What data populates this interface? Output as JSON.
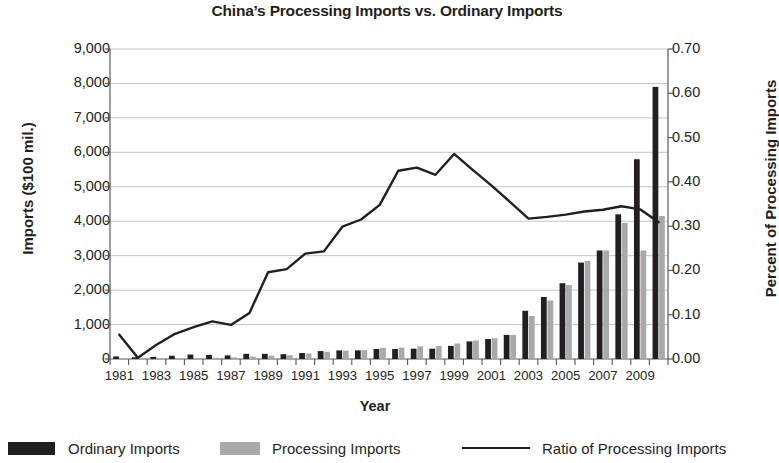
{
  "chart_data": {
    "type": "bar",
    "title": "China’s Processing Imports vs. Ordinary Imports",
    "xlabel": "Year",
    "ylabel": "Imports ($100 mil.)",
    "y2label": "Percent of Processing Imports",
    "ylim": [
      0,
      9000
    ],
    "y2lim": [
      0.0,
      0.7
    ],
    "ytick_labels": [
      "9,000",
      "8,000",
      "7,000",
      "6,000",
      "5,000",
      "4,000",
      "3,000",
      "2,000",
      "1,000",
      "0"
    ],
    "ytick_values": [
      9000,
      8000,
      7000,
      6000,
      5000,
      4000,
      3000,
      2000,
      1000,
      0
    ],
    "y2tick_labels": [
      "0.70",
      "0.60",
      "0.50",
      "0.40",
      "0.30",
      "0.20",
      "0.10",
      "0.00"
    ],
    "y2tick_values": [
      0.7,
      0.6,
      0.5,
      0.4,
      0.3,
      0.2,
      0.1,
      0.0
    ],
    "grid": true,
    "legend_position": "bottom",
    "categories": [
      1981,
      1982,
      1983,
      1984,
      1985,
      1986,
      1987,
      1988,
      1989,
      1990,
      1991,
      1992,
      1993,
      1994,
      1995,
      1996,
      1997,
      1998,
      1999,
      2000,
      2001,
      2002,
      2003,
      2004,
      2005,
      2006,
      2007,
      2008,
      2009,
      2010
    ],
    "xtick_labels": [
      "1981",
      "1983",
      "1985",
      "1987",
      "1989",
      "1991",
      "1993",
      "1995",
      "1997",
      "1999",
      "2001",
      "2003",
      "2005",
      "2007",
      "2009"
    ],
    "series": [
      {
        "name": "Ordinary Imports",
        "type": "bar",
        "color": "#231f20",
        "axis": "left",
        "values": [
          75,
          50,
          60,
          95,
          130,
          120,
          105,
          150,
          150,
          140,
          175,
          230,
          250,
          250,
          290,
          290,
          300,
          300,
          380,
          510,
          580,
          700,
          1400,
          1800,
          2200,
          2800,
          3150,
          4200,
          5800,
          7900
        ]
      },
      {
        "name": "Processing Imports",
        "type": "bar",
        "color": "#a7a9ac",
        "axis": "left",
        "values": [
          5,
          2,
          10,
          20,
          25,
          35,
          45,
          70,
          95,
          110,
          160,
          210,
          240,
          260,
          320,
          330,
          370,
          380,
          450,
          540,
          600,
          700,
          1250,
          1700,
          2150,
          2850,
          3150,
          3950,
          3150,
          4150
        ]
      },
      {
        "name": "Ratio of Processing Imports",
        "type": "line",
        "color": "#231f20",
        "axis": "right",
        "values": [
          0.055,
          0.003,
          0.032,
          0.057,
          0.072,
          0.085,
          0.077,
          0.104,
          0.196,
          0.203,
          0.238,
          0.243,
          0.299,
          0.315,
          0.348,
          0.425,
          0.432,
          0.416,
          0.463,
          0.427,
          0.392,
          0.355,
          0.317,
          0.321,
          0.326,
          0.333,
          0.337,
          0.345,
          0.338,
          0.309
        ]
      }
    ]
  },
  "legend": {
    "items": [
      {
        "label": "Ordinary Imports",
        "marker": "dark-bar-swatch"
      },
      {
        "label": "Processing Imports",
        "marker": "light-bar-swatch"
      },
      {
        "label": "Ratio of Processing Imports",
        "marker": "line-swatch"
      }
    ]
  },
  "colors": {
    "ordinary": "#231f20",
    "processing": "#a7a9ac",
    "ratio_line": "#231f20",
    "grid": "#bcbec0",
    "axis": "#58595b",
    "text": "#231f20"
  }
}
